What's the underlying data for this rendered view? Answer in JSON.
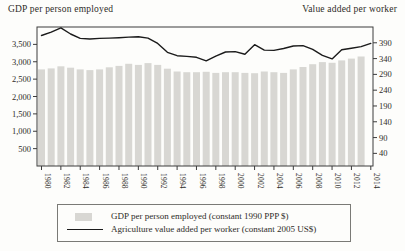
{
  "colors": {
    "bar": "#d8d7d3",
    "line": "#1b1b1b",
    "frame": "#3c3c3c",
    "tick": "#3c3c3c",
    "text": "#2d2c28"
  },
  "legend": {
    "items": [
      {
        "swatch": "bar",
        "label": "GDP per person employed (constant 1990 PPP $)"
      },
      {
        "swatch": "line",
        "label": "Agriculture value added per worker (constant 2005 US$)"
      }
    ]
  },
  "chart_data": {
    "type": "bar",
    "subtype": "bar+line dual axis",
    "x": [
      1980,
      1981,
      1982,
      1983,
      1984,
      1985,
      1986,
      1987,
      1988,
      1989,
      1990,
      1991,
      1992,
      1993,
      1994,
      1995,
      1996,
      1997,
      1998,
      1999,
      2000,
      2001,
      2002,
      2003,
      2004,
      2005,
      2006,
      2007,
      2008,
      2009,
      2010,
      2011,
      2012,
      2013,
      2014
    ],
    "series": [
      {
        "name": "GDP per person employed (constant 1990 PPP $)",
        "type": "bar",
        "axis": "left",
        "values": [
          2780,
          2810,
          2870,
          2830,
          2780,
          2760,
          2780,
          2840,
          2880,
          2940,
          2910,
          2960,
          2910,
          2800,
          2720,
          2700,
          2700,
          2710,
          2680,
          2700,
          2700,
          2680,
          2670,
          2720,
          2700,
          2680,
          2780,
          2850,
          2930,
          2990,
          2970,
          3040,
          3090,
          3150,
          null
        ]
      },
      {
        "name": "Agriculture value added per worker (constant 2005 US$)",
        "type": "line",
        "axis": "right",
        "values": [
          413,
          424,
          437,
          418,
          404,
          402,
          404,
          405,
          406,
          408,
          409,
          405,
          388,
          360,
          349,
          347,
          344,
          333,
          348,
          361,
          362,
          354,
          384,
          367,
          366,
          372,
          380,
          381,
          369,
          350,
          339,
          368,
          373,
          378,
          388
        ]
      }
    ],
    "left_axis": {
      "title": "GDP per person employed",
      "ticks": [
        3500,
        3000,
        2500,
        2000,
        1500,
        1000,
        500
      ],
      "labels": [
        "3,500",
        "3,000",
        "2,500",
        "2,000",
        "1,500",
        "1,000",
        "500"
      ],
      "range": [
        0,
        4000
      ]
    },
    "right_axis": {
      "title": "Value added per worker",
      "ticks": [
        390,
        340,
        290,
        240,
        190,
        140,
        90,
        40
      ],
      "labels": [
        "390",
        "340",
        "290",
        "240",
        "190",
        "140",
        "90",
        "40"
      ],
      "range": [
        0,
        440
      ]
    },
    "x_axis": {
      "labeled_ticks": [
        1980,
        1982,
        1984,
        1986,
        1988,
        1990,
        1992,
        1994,
        1996,
        1998,
        2000,
        2002,
        2004,
        2006,
        2008,
        2010,
        2012,
        2014
      ]
    },
    "grid": false,
    "legend_position": "bottom-boxed"
  }
}
